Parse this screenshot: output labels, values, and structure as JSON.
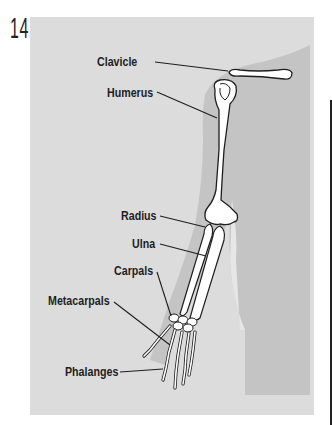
{
  "figure": {
    "number": "14.",
    "labels": [
      {
        "id": "clavicle",
        "text": "Clavicle"
      },
      {
        "id": "humerus",
        "text": "Humerus"
      },
      {
        "id": "radius",
        "text": "Radius"
      },
      {
        "id": "ulna",
        "text": "Ulna"
      },
      {
        "id": "carpals",
        "text": "Carpals"
      },
      {
        "id": "metacarpals",
        "text": "Metacarpals"
      },
      {
        "id": "phalanges",
        "text": "Phalanges"
      }
    ],
    "colors": {
      "background": "#ffffff",
      "panel": "#dcdcdc",
      "arm_silhouette": "#c4c4c4",
      "bone_fill": "#ffffff",
      "outline": "#1e1e1e"
    }
  }
}
